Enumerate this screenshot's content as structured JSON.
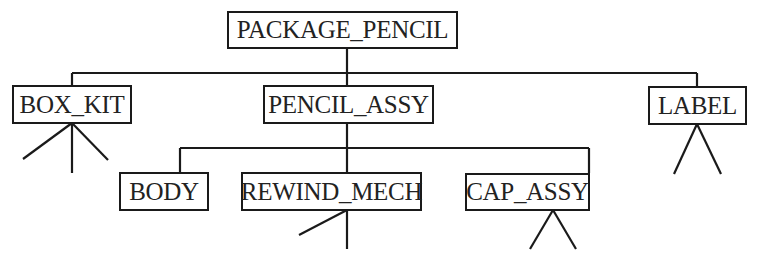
{
  "diagram": {
    "type": "product-structure-tree",
    "line_color": "#1a1a1a",
    "root": {
      "label": "PACKAGE_PENCIL"
    },
    "level1": [
      {
        "label": "BOX_KIT",
        "expansion": "3 sub-branches"
      },
      {
        "label": "PENCIL_ASSY"
      },
      {
        "label": "LABEL",
        "expansion": "2 sub-branches"
      }
    ],
    "level2": [
      {
        "label": "BODY",
        "parent": "PENCIL_ASSY"
      },
      {
        "label": "REWIND_MECH",
        "parent": "PENCIL_ASSY",
        "expansion": "2 sub-branches"
      },
      {
        "label": "CAP_ASSY",
        "parent": "PENCIL_ASSY",
        "expansion": "2 sub-branches"
      }
    ]
  }
}
